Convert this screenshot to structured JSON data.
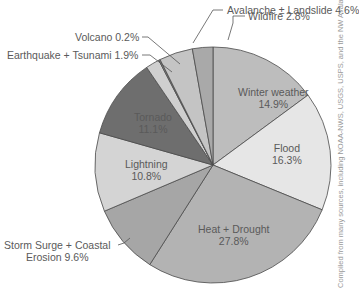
{
  "chart_data": {
    "type": "pie",
    "title": "",
    "start_angle_deg": 0,
    "direction": "clockwise",
    "slices": [
      {
        "label": "Winter weather",
        "value": 14.9,
        "display": "14.9%",
        "color": "#bdbdbd"
      },
      {
        "label": "Flood",
        "value": 16.3,
        "display": "16.3%",
        "color": "#e6e6e6"
      },
      {
        "label": "Heat + Drought",
        "value": 27.8,
        "display": "27.8%",
        "color": "#b3b3b3"
      },
      {
        "label": "Storm Surge + Coastal Erosion",
        "value": 9.6,
        "display": "9.6%",
        "color": "#a6a6a6"
      },
      {
        "label": "Lightning",
        "value": 10.8,
        "display": "10.8%",
        "color": "#d4d4d4"
      },
      {
        "label": "Tornado",
        "value": 11.1,
        "display": "11.1%",
        "color": "#6e6e6e"
      },
      {
        "label": "Earthquake + Tsunami",
        "value": 1.9,
        "display": "1.9%",
        "color": "#cfcfcf"
      },
      {
        "label": "Volcano",
        "value": 0.2,
        "display": "0.2%",
        "color": "#8a8a8a"
      },
      {
        "label": "Avalanche ± Landslide",
        "value": 4.6,
        "display": "4.6%",
        "color": "#c4c4c4"
      },
      {
        "label": "Wildfire",
        "value": 2.8,
        "display": "2.8%",
        "color": "#a9a9a9"
      }
    ],
    "credit": "Compiled from many sources, including NOAA-NWS, USGS, USFS, and the NW Avalanche Center."
  },
  "labels": {
    "winter": {
      "name": "Winter weather",
      "pct": "14.9%"
    },
    "flood": {
      "name": "Flood",
      "pct": "16.3%"
    },
    "heat": {
      "name": "Heat + Drought",
      "pct": "27.8%"
    },
    "storm": {
      "line1": "Storm Surge + Coastal",
      "line2": "Erosion 9.6%"
    },
    "lightning": {
      "name": "Lightning",
      "pct": "10.8%"
    },
    "tornado": {
      "name": "Tornado",
      "pct": "11.1%"
    },
    "earthquake": "Earthquake + Tsunami 1.9%",
    "volcano": "Volcano 0.2%",
    "avalanche": "Avalanche ± Landslide 4.6%",
    "wildfire": "Wildfire 2.8%"
  },
  "credit": "Compiled from many sources, including NOAA-NWS, USGS, USPS, and the NW Avalanche Center."
}
